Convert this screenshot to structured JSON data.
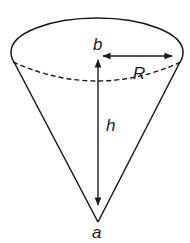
{
  "diagram": {
    "type": "cone",
    "labels": {
      "top_center": "b",
      "apex": "a",
      "radius": "R",
      "height": "h"
    },
    "colors": {
      "stroke": "#1a1a1a",
      "background": "#ffffff"
    }
  }
}
